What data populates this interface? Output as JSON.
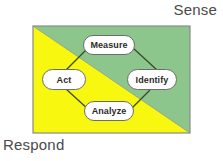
{
  "diagram": {
    "title_sense": "Sense",
    "title_respond": "Respond",
    "colors": {
      "sense_region": "#8CC68C",
      "respond_region": "#F7F70F",
      "border": "#808080",
      "connector": "#3a4a28",
      "node_fill": "#FFFFFF",
      "node_border": "#6D6D6D",
      "text": "#4A4A4A"
    },
    "regions": [
      {
        "name": "sense",
        "label": "Sense",
        "fill": "#8CC68C",
        "corner": "top-right"
      },
      {
        "name": "respond",
        "label": "Respond",
        "fill": "#F7F70F",
        "corner": "bottom-left"
      }
    ],
    "nodes": [
      {
        "id": "measure",
        "label": "Measure"
      },
      {
        "id": "identify",
        "label": "Identify"
      },
      {
        "id": "analyze",
        "label": "Analyze"
      },
      {
        "id": "act",
        "label": "Act"
      }
    ],
    "connectors": [
      {
        "from": "measure",
        "to": "identify"
      },
      {
        "from": "identify",
        "to": "analyze"
      },
      {
        "from": "analyze",
        "to": "act"
      },
      {
        "from": "act",
        "to": "measure"
      }
    ]
  }
}
